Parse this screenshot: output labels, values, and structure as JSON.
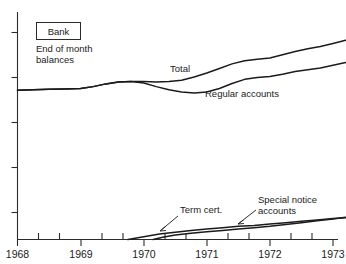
{
  "chart_data": {
    "type": "line",
    "title": "Bank",
    "subtitle": "End of month balances",
    "xlabel": "",
    "ylabel": "",
    "grid": false,
    "legend_position": "inline-annotations",
    "xlim": [
      1968,
      1973.25
    ],
    "ylim": [
      0,
      5
    ],
    "x_tick_labels": [
      "1968",
      "1969",
      "1970",
      "1971",
      "1972",
      "1973"
    ],
    "x_ticks": [
      1968,
      1969,
      1970,
      1971,
      1972,
      1973
    ],
    "x_minor_ticks": [
      1968.33,
      1968.67,
      1969.33,
      1969.67,
      1970.33,
      1970.67,
      1971.33,
      1971.67,
      1972.33,
      1972.67,
      1973.0
    ],
    "y_ticks": [
      1,
      2,
      3,
      4,
      5
    ],
    "y_tick_labels": [
      "",
      "",
      "",
      "",
      ""
    ],
    "series": [
      {
        "name": "Total",
        "label": "Total",
        "x": [
          1968.0,
          1968.25,
          1968.5,
          1968.75,
          1969.0,
          1969.2,
          1969.4,
          1969.6,
          1969.8,
          1970.0,
          1970.2,
          1970.4,
          1970.6,
          1970.8,
          1971.0,
          1971.2,
          1971.4,
          1971.6,
          1971.8,
          1972.0,
          1972.2,
          1972.4,
          1972.6,
          1972.8,
          1973.0,
          1973.2
        ],
        "values": [
          3.28,
          3.29,
          3.3,
          3.31,
          3.32,
          3.36,
          3.42,
          3.46,
          3.47,
          3.47,
          3.46,
          3.47,
          3.5,
          3.57,
          3.66,
          3.76,
          3.86,
          3.93,
          3.96,
          3.99,
          4.06,
          4.13,
          4.19,
          4.24,
          4.31,
          4.38
        ]
      },
      {
        "name": "Regular accounts",
        "label": "Regular accounts",
        "x": [
          1968.0,
          1968.25,
          1968.5,
          1968.75,
          1969.0,
          1969.2,
          1969.4,
          1969.6,
          1969.8,
          1970.0,
          1970.2,
          1970.4,
          1970.6,
          1970.8,
          1971.0,
          1971.2,
          1971.4,
          1971.6,
          1971.8,
          1972.0,
          1972.2,
          1972.4,
          1972.6,
          1972.8,
          1973.0,
          1973.2
        ],
        "values": [
          3.28,
          3.29,
          3.3,
          3.31,
          3.32,
          3.36,
          3.42,
          3.46,
          3.47,
          3.44,
          3.36,
          3.29,
          3.24,
          3.22,
          3.24,
          3.32,
          3.43,
          3.52,
          3.56,
          3.58,
          3.63,
          3.69,
          3.73,
          3.77,
          3.83,
          3.89
        ]
      },
      {
        "name": "Term cert.",
        "label": "Term cert.",
        "x": [
          1969.75,
          1970.0,
          1970.25,
          1970.5,
          1970.75,
          1971.0,
          1971.25,
          1971.5,
          1971.75,
          1972.0,
          1972.25,
          1972.5,
          1972.75,
          1973.0,
          1973.2
        ],
        "values": [
          0.0,
          0.06,
          0.12,
          0.16,
          0.2,
          0.23,
          0.26,
          0.29,
          0.31,
          0.34,
          0.37,
          0.4,
          0.43,
          0.46,
          0.48
        ]
      },
      {
        "name": "Special notice accounts",
        "label": "Special notice accounts",
        "x": [
          1970.15,
          1970.3,
          1970.5,
          1970.75,
          1971.0,
          1971.25,
          1971.5,
          1971.75,
          1972.0,
          1972.25,
          1972.5,
          1972.75,
          1973.0,
          1973.2
        ],
        "values": [
          0.0,
          0.05,
          0.1,
          0.14,
          0.17,
          0.2,
          0.23,
          0.26,
          0.29,
          0.33,
          0.37,
          0.41,
          0.45,
          0.49
        ]
      }
    ],
    "annotations": [
      {
        "text": "Total",
        "series": "Total"
      },
      {
        "text": "Regular accounts",
        "series": "Regular accounts"
      },
      {
        "text": "Term cert.",
        "series": "Term cert."
      },
      {
        "text": "Special notice accounts",
        "series": "Special notice accounts"
      }
    ],
    "colors": {
      "line": "#1b1b1b",
      "axis": "#2b2b2b",
      "background": "#ffffff"
    }
  },
  "header": {
    "box_label": "Bank",
    "note_line_1": "End of month",
    "note_line_2": "balances"
  },
  "labels": {
    "total": "Total",
    "regular_accounts": "Regular accounts",
    "term_cert": "Term cert.",
    "special_notice_line_1": "Special notice",
    "special_notice_line_2": "accounts"
  },
  "axis": {
    "x_labels": [
      "1968",
      "1969",
      "1970",
      "1971",
      "1972",
      "1973"
    ]
  }
}
